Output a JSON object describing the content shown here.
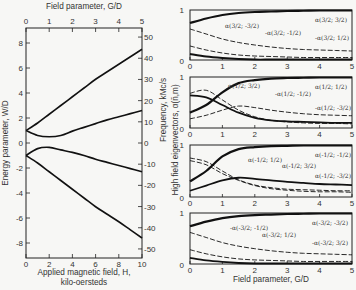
{
  "chart_data": [
    {
      "type": "line",
      "title": "Energy levels vs applied magnetic field",
      "top_xlabel": "Field parameter, G/D",
      "top_xticks": [
        0,
        1,
        2,
        3,
        4,
        5
      ],
      "xlabel": "Applied magnetic field, H,",
      "xlabel2": "kilo-oersteds",
      "xticks": [
        0,
        2,
        4,
        6,
        8,
        10
      ],
      "ylabel": "Energy parameter, W/D",
      "yticks": [
        -8,
        -6,
        -4,
        -2,
        0,
        2,
        4,
        6,
        8
      ],
      "ylim": [
        -9.2,
        9.2
      ],
      "right_ylabel": "Frequency, kMc/s",
      "right_yticks": [
        -50,
        -40,
        -30,
        -20,
        -10,
        0,
        10,
        20,
        30,
        40,
        50
      ],
      "x": [
        0,
        0.5,
        1,
        1.5,
        2,
        2.5,
        3,
        3.5,
        4,
        4.5,
        5
      ],
      "series": [
        {
          "name": "level 1",
          "values": [
            1.0,
            1.6,
            2.3,
            3.0,
            3.7,
            4.4,
            5.1,
            5.7,
            6.3,
            6.9,
            7.5
          ]
        },
        {
          "name": "level 2",
          "values": [
            1.0,
            0.6,
            0.5,
            0.6,
            0.95,
            1.25,
            1.55,
            1.85,
            2.1,
            2.35,
            2.6
          ]
        },
        {
          "name": "level 3",
          "values": [
            -1.0,
            -0.45,
            -0.35,
            -0.55,
            -0.75,
            -1.0,
            -1.3,
            -1.55,
            -1.8,
            -2.05,
            -2.3
          ]
        },
        {
          "name": "level 4",
          "values": [
            -1.0,
            -1.6,
            -2.3,
            -3.0,
            -3.7,
            -4.4,
            -5.1,
            -5.7,
            -6.3,
            -6.95,
            -7.6
          ]
        }
      ]
    },
    {
      "type": "line",
      "title": "High field eigenvectors, panel 1",
      "xticks": [
        0,
        1,
        2,
        3,
        4,
        5
      ],
      "yticks": [
        0,
        1
      ],
      "ylim": [
        0,
        1
      ],
      "x": [
        0,
        0.5,
        1,
        1.5,
        2,
        2.5,
        3,
        3.5,
        4,
        4.5,
        5
      ],
      "series": [
        {
          "name": "α(3/2; 3/2)",
          "values": [
            0.74,
            0.83,
            0.9,
            0.94,
            0.96,
            0.97,
            0.98,
            0.985,
            0.99,
            0.99,
            0.99
          ]
        },
        {
          "name": "α(3/2; -3/2)",
          "values": [
            0.62,
            0.52,
            0.42,
            0.35,
            0.3,
            0.26,
            0.23,
            0.21,
            0.2,
            0.19,
            0.18
          ]
        },
        {
          "name": "-α(3/2; -1/2)",
          "values": [
            0.28,
            0.2,
            0.14,
            0.1,
            0.08,
            0.07,
            0.06,
            0.05,
            0.05,
            0.05,
            0.05
          ]
        },
        {
          "name": "-α(3/2; 1/2)",
          "values": [
            0.12,
            0.07,
            0.04,
            0.02,
            0.01,
            0.01,
            0.01,
            0.01,
            0.01,
            0.01,
            0.01
          ]
        }
      ]
    },
    {
      "type": "line",
      "title": "High field eigenvectors, panel 2",
      "xticks": [
        0,
        1,
        2,
        3,
        4,
        5
      ],
      "yticks": [
        0,
        1
      ],
      "ylim": [
        0,
        1
      ],
      "x": [
        0,
        0.5,
        1,
        1.5,
        2,
        2.5,
        3,
        3.5,
        4,
        4.5,
        5
      ],
      "series": [
        {
          "name": "α(1/2; 1/2)",
          "values": [
            0.3,
            0.45,
            0.7,
            0.88,
            0.94,
            0.97,
            0.98,
            0.985,
            0.99,
            0.99,
            0.99
          ]
        },
        {
          "name": "α(1/2; 3/2)",
          "values": [
            0.18,
            0.25,
            0.35,
            0.43,
            0.4,
            0.35,
            0.31,
            0.28,
            0.26,
            0.25,
            0.24
          ]
        },
        {
          "name": "-α(1/2; -1/2)",
          "values": [
            0.68,
            0.74,
            0.55,
            0.35,
            0.22,
            0.15,
            0.12,
            0.1,
            0.09,
            0.09,
            0.08
          ]
        },
        {
          "name": "-α(1/2; -3/2)",
          "values": [
            0.64,
            0.6,
            0.45,
            0.3,
            0.2,
            0.15,
            0.13,
            0.12,
            0.11,
            0.1,
            0.1
          ]
        }
      ]
    },
    {
      "type": "line",
      "title": "High field eigenvectors, panel 3",
      "xticks": [
        0,
        1,
        2,
        3,
        4,
        5
      ],
      "yticks": [
        0,
        1
      ],
      "ylim": [
        0,
        1
      ],
      "x": [
        0,
        0.5,
        1,
        1.5,
        2,
        2.5,
        3,
        3.5,
        4,
        4.5,
        5
      ],
      "series": [
        {
          "name": "α(-1/2; -1/2)",
          "values": [
            0.3,
            0.5,
            0.78,
            0.92,
            0.96,
            0.98,
            0.985,
            0.99,
            0.99,
            0.99,
            0.99
          ]
        },
        {
          "name": "α(-1/2; 1/2)",
          "values": [
            0.75,
            0.68,
            0.5,
            0.33,
            0.23,
            0.18,
            0.15,
            0.14,
            0.13,
            0.12,
            0.12
          ]
        },
        {
          "name": "α(-1/2; 3/2)",
          "values": [
            0.7,
            0.62,
            0.45,
            0.32,
            0.22,
            0.16,
            0.13,
            0.11,
            0.1,
            0.1,
            0.09
          ]
        },
        {
          "name": "α(-1/2; -3/2)",
          "values": [
            0.12,
            0.22,
            0.32,
            0.37,
            0.35,
            0.32,
            0.29,
            0.27,
            0.25,
            0.24,
            0.23
          ]
        }
      ]
    },
    {
      "type": "line",
      "title": "High field eigenvectors, panel 4",
      "xlabel": "Field parameter, G/D",
      "xticks": [
        0,
        1,
        2,
        3,
        4,
        5
      ],
      "yticks": [
        0,
        1
      ],
      "ylim": [
        0,
        1
      ],
      "x": [
        0,
        0.5,
        1,
        1.5,
        2,
        2.5,
        3,
        3.5,
        4,
        4.5,
        5
      ],
      "series": [
        {
          "name": "α(-3/2; -3/2)",
          "values": [
            0.74,
            0.83,
            0.9,
            0.94,
            0.96,
            0.97,
            0.98,
            0.985,
            0.99,
            0.99,
            0.99
          ]
        },
        {
          "name": "-α(-3/2; -1/2)",
          "values": [
            0.62,
            0.52,
            0.42,
            0.35,
            0.3,
            0.26,
            0.23,
            0.21,
            0.2,
            0.19,
            0.18
          ]
        },
        {
          "name": "α(-3/2; 1/2)",
          "values": [
            0.28,
            0.2,
            0.14,
            0.1,
            0.08,
            0.07,
            0.06,
            0.05,
            0.05,
            0.05,
            0.05
          ]
        },
        {
          "name": "-α(-3/2; 3/2)",
          "values": [
            0.12,
            0.07,
            0.04,
            0.02,
            0.01,
            0.01,
            0.01,
            0.01,
            0.01,
            0.01,
            0.01
          ]
        }
      ]
    }
  ],
  "labels": {
    "left_top_axis": "Field parameter, G/D",
    "left_y_axis": "Energy parameter, W/D",
    "left_right_axis": "Frequency, kMc/s",
    "left_bottom_axis_1": "Applied magnetic field, H,",
    "left_bottom_axis_2": "kilo-oersteds",
    "right_y_axis": "High field eigenvectors, α(n̄,m)",
    "right_bottom_axis": "Field parameter, G/D",
    "panel_curves": [
      [
        "α(3/2;3/2)",
        "α(3/2;-3/2)",
        "-α(3/2;-1/2)",
        "-α(3/2;1/2)"
      ],
      [
        "α(1/2;1/2)",
        "-α(1/2;-1/2)",
        "-α(1/2;-3/2)",
        "α(1/2;3/2)"
      ],
      [
        "α(-1/2;-1/2)",
        "α(-1/2;1/2)",
        "α(-1/2;3/2)",
        "α(-1/2;-3/2)"
      ],
      [
        "α(-3/2;-3/2)",
        "-α(-3/2;3/2)",
        "α(-3/2;1/2)",
        "-α(-3/2;-1/2)"
      ]
    ]
  }
}
